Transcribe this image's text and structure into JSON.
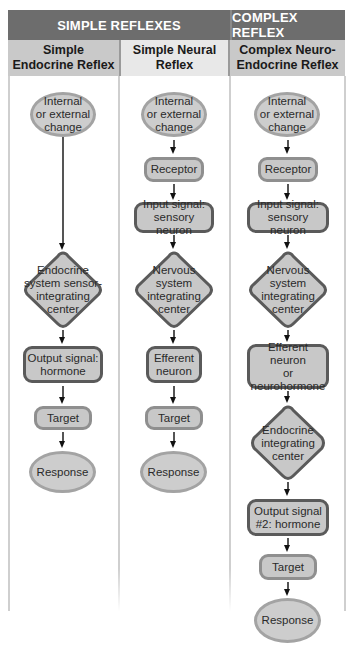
{
  "header": {
    "simple_reflexes": "SIMPLE REFLEXES",
    "complex_reflex": "COMPLEX REFLEX"
  },
  "columns": [
    {
      "title": "Simple Endocrine Reflex",
      "title_lines": [
        "Simple",
        "Endocrine Reflex"
      ],
      "steps": [
        {
          "shape": "ellipse",
          "text": "Internal or external change"
        },
        {
          "shape": "diamond",
          "text": "Endocrine system sensor-integrating center"
        },
        {
          "shape": "box-dark",
          "text": "Output signal: hormone"
        },
        {
          "shape": "box-light",
          "text": "Target"
        },
        {
          "shape": "ellipse",
          "text": "Response"
        }
      ]
    },
    {
      "title": "Simple Neural Reflex",
      "title_lines": [
        "Simple Neural",
        "Reflex"
      ],
      "steps": [
        {
          "shape": "ellipse",
          "text": "Internal or external change"
        },
        {
          "shape": "box-light",
          "text": "Receptor"
        },
        {
          "shape": "box-dark",
          "text": "Input signal: sensory neuron"
        },
        {
          "shape": "diamond",
          "text": "Nervous system integrating center"
        },
        {
          "shape": "box-dark",
          "text": "Efferent neuron"
        },
        {
          "shape": "box-light",
          "text": "Target"
        },
        {
          "shape": "ellipse",
          "text": "Response"
        }
      ]
    },
    {
      "title": "Complex Neuro-Endocrine Reflex",
      "title_lines": [
        "Complex Neuro-",
        "Endocrine Reflex"
      ],
      "steps": [
        {
          "shape": "ellipse",
          "text": "Internal or external change"
        },
        {
          "shape": "box-light",
          "text": "Receptor"
        },
        {
          "shape": "box-dark",
          "text": "Input signal: sensory neuron"
        },
        {
          "shape": "diamond",
          "text": "Nervous system integrating center"
        },
        {
          "shape": "box-dark",
          "text": "Efferent neuron or neurohormone"
        },
        {
          "shape": "diamond",
          "text": "Endocrine integrating center"
        },
        {
          "shape": "box-dark",
          "text": "Output signal #2: hormone"
        },
        {
          "shape": "box-light",
          "text": "Target"
        },
        {
          "shape": "ellipse",
          "text": "Response"
        }
      ]
    }
  ],
  "lines": {
    "c1_l1": "Internal",
    "c1_l2": "or external",
    "c1_l3": "change",
    "c1_d1": "Endocrine",
    "c1_d2": "system sensor-",
    "c1_d3": "integrating",
    "c1_d4": "center",
    "c1_o1": "Output signal:",
    "c1_o2": "hormone",
    "target": "Target",
    "response": "Response",
    "receptor": "Receptor",
    "in1": "Input signal:",
    "in2": "sensory neuron",
    "nd1": "Nervous",
    "nd2": "system",
    "nd3": "integrating",
    "nd4": "center",
    "ef1": "Efferent",
    "ef2": "neuron",
    "c3_ef1": "Efferent neuron",
    "c3_ef2": "or",
    "c3_ef3": "neurohormone",
    "ed1": "Endocrine",
    "ed2": "integrating",
    "ed3": "center",
    "o2_1": "Output signal",
    "o2_2": "#2: hormone"
  },
  "colors": {
    "header_bg": "#6d6d6d",
    "subheader_dark": "#c9c9c9",
    "subheader_light": "#e8e8e8",
    "shape_fill": "#c8c8c8",
    "shape_border_light": "#8f8f8f",
    "shape_border_dark": "#5a5a5a",
    "ellipse_border": "#a3a3a3"
  }
}
